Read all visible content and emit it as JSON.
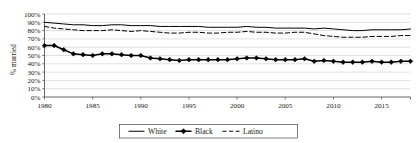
{
  "chart_data": {
    "type": "line",
    "title": "",
    "xlabel": "",
    "ylabel": "% married",
    "xlim": [
      1980,
      2018
    ],
    "ylim": [
      0,
      100
    ],
    "ytick_labels": [
      "100%",
      "90%",
      "80%",
      "70%",
      "60%",
      "50%",
      "40%",
      "30%",
      "20%",
      "10%",
      "0%"
    ],
    "ytick_values": [
      100,
      90,
      80,
      70,
      60,
      50,
      40,
      30,
      20,
      10,
      0
    ],
    "xtick_labels": [
      "1980",
      "1985",
      "1990",
      "1995",
      "2000",
      "2005",
      "2010",
      "2015"
    ],
    "xtick_values": [
      1980,
      1985,
      1990,
      1995,
      2000,
      2005,
      2010,
      2015
    ],
    "grid": true,
    "grid_axis": "y",
    "legend_position": "bottom",
    "x": [
      1980,
      1981,
      1982,
      1983,
      1984,
      1985,
      1986,
      1987,
      1988,
      1989,
      1990,
      1991,
      1992,
      1993,
      1994,
      1995,
      1996,
      1997,
      1998,
      1999,
      2000,
      2001,
      2002,
      2003,
      2004,
      2005,
      2006,
      2007,
      2008,
      2009,
      2010,
      2011,
      2012,
      2013,
      2014,
      2015,
      2016,
      2017,
      2018
    ],
    "series": [
      {
        "name": "White",
        "style": "solid",
        "marker": "none",
        "color": "#000000",
        "values": [
          90,
          89,
          88,
          87,
          87,
          86,
          86,
          87,
          87,
          86,
          86,
          86,
          85,
          85,
          85,
          85,
          85,
          84,
          84,
          84,
          84,
          85,
          84,
          84,
          83,
          83,
          83,
          83,
          82,
          83,
          82,
          81,
          80,
          80,
          81,
          81,
          81,
          81,
          82
        ]
      },
      {
        "name": "Black",
        "style": "solid",
        "marker": "diamond",
        "color": "#000000",
        "values": [
          62,
          62,
          57,
          52,
          51,
          50,
          52,
          52,
          51,
          50,
          50,
          47,
          46,
          45,
          44,
          45,
          45,
          45,
          45,
          45,
          46,
          47,
          47,
          46,
          45,
          45,
          45,
          46,
          43,
          44,
          43,
          42,
          42,
          42,
          43,
          42,
          42,
          43,
          43
        ]
      },
      {
        "name": "Latino",
        "style": "dashed",
        "marker": "none",
        "color": "#000000",
        "values": [
          85,
          83,
          82,
          81,
          80,
          80,
          80,
          81,
          80,
          79,
          80,
          79,
          78,
          77,
          77,
          78,
          78,
          77,
          77,
          78,
          78,
          79,
          78,
          78,
          77,
          77,
          78,
          78,
          76,
          74,
          73,
          72,
          72,
          72,
          73,
          73,
          73,
          74,
          74
        ]
      }
    ],
    "legend": [
      {
        "label": "White",
        "style": "solid",
        "marker": "none"
      },
      {
        "label": "Black",
        "style": "solid",
        "marker": "diamond"
      },
      {
        "label": "Latino",
        "style": "dashed",
        "marker": "none"
      }
    ]
  }
}
